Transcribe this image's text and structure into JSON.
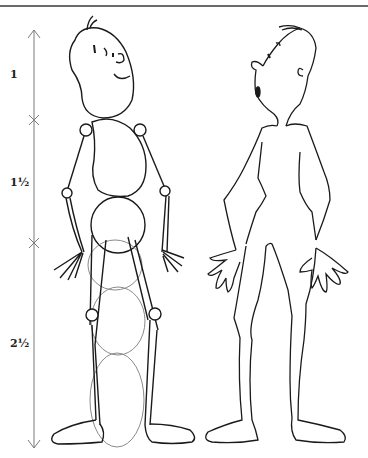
{
  "diagram": {
    "scale": {
      "segments": [
        {
          "label": "1",
          "part": "head"
        },
        {
          "label": "1½",
          "part": "torso"
        },
        {
          "label": "2½",
          "part": "legs"
        }
      ]
    },
    "figures": [
      {
        "name": "construction-figure",
        "description": "figure built from circles and stick limbs"
      },
      {
        "name": "finished-figure",
        "description": "outlined figure with hands and feet"
      }
    ],
    "colors": {
      "line": "#1a1a1a",
      "guide": "#7a7a7a",
      "rule": "#6a6a6a"
    }
  }
}
